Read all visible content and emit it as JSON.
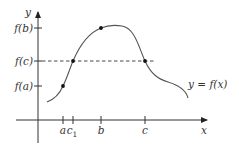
{
  "figure": {
    "axes": {
      "x_label": "x",
      "y_label": "y"
    },
    "x_ticks": [
      "a",
      "c1",
      "b",
      "c"
    ],
    "x_tick_labels": {
      "a": "a",
      "c1_main": "c",
      "c1_sub": "1",
      "b": "b",
      "c": "c"
    },
    "y_ticks": {
      "fb": "f(b)",
      "fc": "f(c)",
      "fa": "f(a)"
    },
    "curve_label": "y = f(x)",
    "marked_points": [
      "(a, f(a))",
      "(c1, f(c))",
      "(b, f(b))",
      "(c, f(c))"
    ],
    "colors": {
      "axis": "#333333",
      "curve": "#555555",
      "points": "#111111"
    }
  }
}
